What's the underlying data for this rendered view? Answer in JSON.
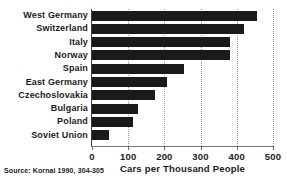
{
  "chart_data": {
    "type": "bar",
    "orientation": "horizontal",
    "title": "",
    "xlabel": "Cars per Thousand People",
    "ylabel": "",
    "xlim": [
      0,
      500
    ],
    "xticks": [
      "0",
      "100",
      "200",
      "300",
      "400",
      "500"
    ],
    "xtick_values": [
      0,
      100,
      200,
      300,
      400,
      500
    ],
    "grid": "vertical-dotted",
    "legend": "none",
    "categories": [
      "West Germany",
      "Switzerland",
      "Italy",
      "Norway",
      "Spain",
      "East Germany",
      "Czechoslovakia",
      "Bulgaria",
      "Poland",
      "Soviet Union"
    ],
    "values": [
      456,
      420,
      381,
      380,
      253,
      208,
      175,
      128,
      112,
      47
    ],
    "bar_color": "#1a1a1a"
  },
  "footer": {
    "source": "Source:  Kornai 1990, 304-305"
  }
}
